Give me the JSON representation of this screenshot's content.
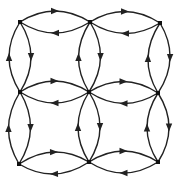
{
  "diagram": {
    "type": "directed-grid-graph",
    "colors": {
      "background": "#ffffff",
      "edge": "#222222",
      "node": "#111111"
    },
    "nodes": [
      {
        "id": "n00",
        "row": 0,
        "col": 0,
        "x": 20,
        "y": 22
      },
      {
        "id": "n01",
        "row": 0,
        "col": 1,
        "x": 90,
        "y": 22
      },
      {
        "id": "n02",
        "row": 0,
        "col": 2,
        "x": 160,
        "y": 23
      },
      {
        "id": "n10",
        "row": 1,
        "col": 0,
        "x": 20,
        "y": 92
      },
      {
        "id": "n11",
        "row": 1,
        "col": 1,
        "x": 89,
        "y": 92
      },
      {
        "id": "n12",
        "row": 1,
        "col": 2,
        "x": 158,
        "y": 93
      },
      {
        "id": "n20",
        "row": 2,
        "col": 0,
        "x": 19,
        "y": 164
      },
      {
        "id": "n21",
        "row": 2,
        "col": 1,
        "x": 89,
        "y": 162
      },
      {
        "id": "n22",
        "row": 2,
        "col": 2,
        "x": 158,
        "y": 162
      }
    ],
    "edges": [
      {
        "from": "n00",
        "to": "n01",
        "bend": "up"
      },
      {
        "from": "n01",
        "to": "n00",
        "bend": "down"
      },
      {
        "from": "n01",
        "to": "n02",
        "bend": "up"
      },
      {
        "from": "n02",
        "to": "n01",
        "bend": "down"
      },
      {
        "from": "n10",
        "to": "n11",
        "bend": "up"
      },
      {
        "from": "n11",
        "to": "n10",
        "bend": "down"
      },
      {
        "from": "n11",
        "to": "n12",
        "bend": "up"
      },
      {
        "from": "n12",
        "to": "n11",
        "bend": "down"
      },
      {
        "from": "n20",
        "to": "n21",
        "bend": "up"
      },
      {
        "from": "n21",
        "to": "n20",
        "bend": "down"
      },
      {
        "from": "n21",
        "to": "n22",
        "bend": "up"
      },
      {
        "from": "n22",
        "to": "n21",
        "bend": "down"
      },
      {
        "from": "n10",
        "to": "n00",
        "bend": "left"
      },
      {
        "from": "n00",
        "to": "n10",
        "bend": "right"
      },
      {
        "from": "n20",
        "to": "n10",
        "bend": "left"
      },
      {
        "from": "n10",
        "to": "n20",
        "bend": "right"
      },
      {
        "from": "n11",
        "to": "n01",
        "bend": "left"
      },
      {
        "from": "n01",
        "to": "n11",
        "bend": "right"
      },
      {
        "from": "n21",
        "to": "n11",
        "bend": "left"
      },
      {
        "from": "n11",
        "to": "n21",
        "bend": "right"
      },
      {
        "from": "n12",
        "to": "n02",
        "bend": "left"
      },
      {
        "from": "n02",
        "to": "n12",
        "bend": "right"
      },
      {
        "from": "n22",
        "to": "n12",
        "bend": "left"
      },
      {
        "from": "n12",
        "to": "n22",
        "bend": "right"
      }
    ],
    "curve_offset": 11,
    "node_size": 4,
    "edge_width": 1.4
  }
}
